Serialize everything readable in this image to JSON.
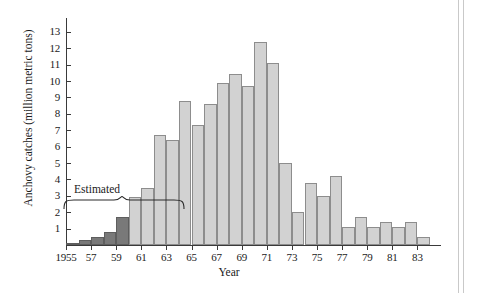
{
  "chart_data": {
    "type": "bar",
    "title": "",
    "xlabel": "Year",
    "ylabel": "Anchovy catches (million metric tons)",
    "ylim": [
      0,
      13
    ],
    "yticks": [
      1,
      2,
      3,
      4,
      5,
      6,
      7,
      8,
      9,
      10,
      11,
      12,
      13
    ],
    "ytick_labels": [
      "1",
      "2",
      "3",
      "4",
      "5",
      "6",
      "7",
      "8",
      "9",
      "10",
      "11",
      "12",
      "13"
    ],
    "xlim": [
      1955,
      1984
    ],
    "xticks": [
      1955,
      1957,
      1959,
      1961,
      1963,
      1965,
      1967,
      1969,
      1971,
      1973,
      1975,
      1977,
      1979,
      1981,
      1983
    ],
    "xtick_labels": [
      "1955",
      "57",
      "59",
      "61",
      "63",
      "65",
      "67",
      "69",
      "71",
      "73",
      "75",
      "77",
      "79",
      "81",
      "83"
    ],
    "grid": false,
    "legend": "none",
    "categories": [
      1955,
      1956,
      1957,
      1958,
      1959,
      1960,
      1961,
      1962,
      1963,
      1964,
      1965,
      1966,
      1967,
      1968,
      1969,
      1970,
      1971,
      1972,
      1973,
      1974,
      1975,
      1976,
      1977,
      1978,
      1979,
      1980,
      1981,
      1982,
      1983
    ],
    "values": [
      0.1,
      0.3,
      0.5,
      0.8,
      1.7,
      2.9,
      3.5,
      6.7,
      6.4,
      8.8,
      7.3,
      8.6,
      9.9,
      10.4,
      9.7,
      12.4,
      11.1,
      5.0,
      2.0,
      3.8,
      3.0,
      4.2,
      1.1,
      1.7,
      1.1,
      1.4,
      1.1,
      1.4,
      0.5
    ],
    "annotations": [
      {
        "text": "Estimated",
        "covers": [
          1955,
          1956,
          1957,
          1958,
          1959
        ],
        "style": "curly-brace"
      }
    ],
    "series_colors": {
      "bar_fill": "#d2d2d2",
      "bar_edge": "#8d8d8d",
      "estimated_fill": "#797979",
      "estimated_edge": "#5e5e5e",
      "axis": "#3a3a3a"
    }
  }
}
